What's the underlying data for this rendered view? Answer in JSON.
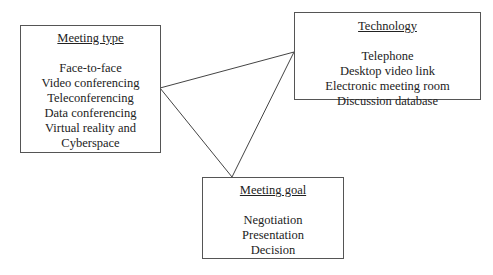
{
  "diagram": {
    "nodes": [
      {
        "id": "meeting-type",
        "title": "Meeting type",
        "items": [
          "Face-to-face",
          "Video conferencing",
          "Teleconferencing",
          "Data conferencing",
          "Virtual reality and",
          "Cyberspace"
        ]
      },
      {
        "id": "technology",
        "title": "Technology",
        "items": [
          "Telephone",
          "Desktop video link",
          "Electronic meeting room",
          "Discussion database"
        ]
      },
      {
        "id": "meeting-goal",
        "title": "Meeting goal",
        "items": [
          "Negotiation",
          "Presentation",
          "Decision"
        ]
      }
    ],
    "edges": [
      {
        "from": "meeting-type",
        "to": "technology"
      },
      {
        "from": "meeting-type",
        "to": "meeting-goal"
      },
      {
        "from": "technology",
        "to": "meeting-goal"
      }
    ]
  }
}
